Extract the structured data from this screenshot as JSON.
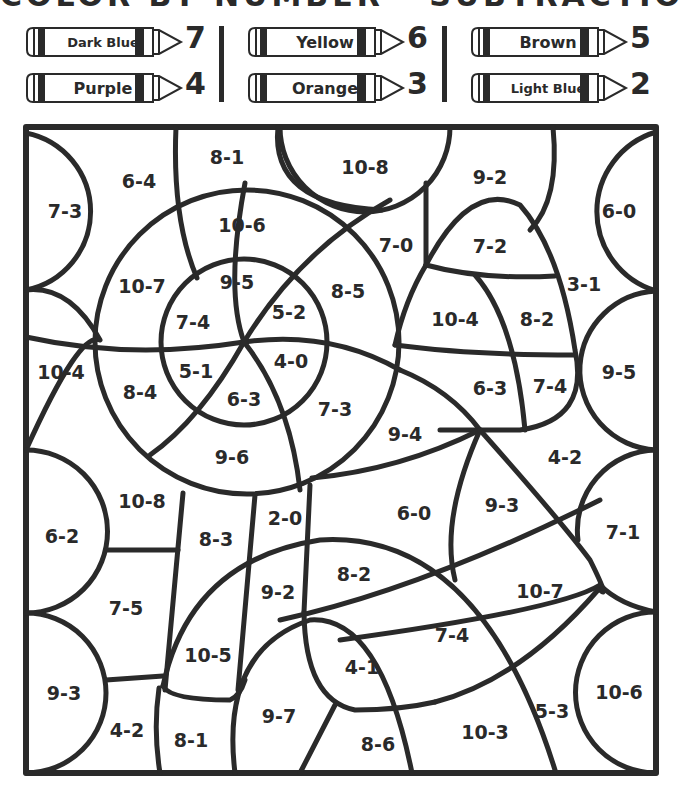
{
  "title": "COLOR BY NUMBER - SUBTRACTION",
  "legend": [
    {
      "color": "Dark Blue",
      "number": "7",
      "x": 25,
      "y": 26
    },
    {
      "color": "Purple",
      "number": "4",
      "x": 25,
      "y": 72
    },
    {
      "color": "Yellow",
      "number": "6",
      "x": 247,
      "y": 26
    },
    {
      "color": "Orange",
      "number": "3",
      "x": 247,
      "y": 72
    },
    {
      "color": "Brown",
      "number": "5",
      "x": 470,
      "y": 26
    },
    {
      "color": "Light Blue",
      "number": "2",
      "x": 470,
      "y": 72
    }
  ],
  "regions": [
    {
      "label": "7-3",
      "x": 65,
      "y": 212
    },
    {
      "label": "6-4",
      "x": 139,
      "y": 182
    },
    {
      "label": "8-1",
      "x": 227,
      "y": 158
    },
    {
      "label": "10-8",
      "x": 365,
      "y": 168
    },
    {
      "label": "9-2",
      "x": 490,
      "y": 178
    },
    {
      "label": "6-0",
      "x": 619,
      "y": 212
    },
    {
      "label": "10-6",
      "x": 242,
      "y": 226
    },
    {
      "label": "7-0",
      "x": 396,
      "y": 246
    },
    {
      "label": "7-2",
      "x": 490,
      "y": 247
    },
    {
      "label": "10-7",
      "x": 142,
      "y": 287
    },
    {
      "label": "9-5",
      "x": 237,
      "y": 283
    },
    {
      "label": "8-5",
      "x": 348,
      "y": 292
    },
    {
      "label": "3-1",
      "x": 584,
      "y": 285
    },
    {
      "label": "7-4",
      "x": 193,
      "y": 323
    },
    {
      "label": "5-2",
      "x": 289,
      "y": 313
    },
    {
      "label": "10-4",
      "x": 455,
      "y": 320
    },
    {
      "label": "8-2",
      "x": 537,
      "y": 320
    },
    {
      "label": "10-4",
      "x": 61,
      "y": 373
    },
    {
      "label": "5-1",
      "x": 196,
      "y": 372
    },
    {
      "label": "4-0",
      "x": 291,
      "y": 362
    },
    {
      "label": "8-4",
      "x": 140,
      "y": 393
    },
    {
      "label": "6-3",
      "x": 244,
      "y": 400
    },
    {
      "label": "6-3",
      "x": 490,
      "y": 389
    },
    {
      "label": "7-4",
      "x": 550,
      "y": 387
    },
    {
      "label": "9-5",
      "x": 619,
      "y": 373
    },
    {
      "label": "7-3",
      "x": 335,
      "y": 410
    },
    {
      "label": "9-4",
      "x": 405,
      "y": 435
    },
    {
      "label": "9-6",
      "x": 232,
      "y": 458
    },
    {
      "label": "4-2",
      "x": 565,
      "y": 458
    },
    {
      "label": "10-8",
      "x": 142,
      "y": 502
    },
    {
      "label": "9-3",
      "x": 502,
      "y": 506
    },
    {
      "label": "6-0",
      "x": 414,
      "y": 514
    },
    {
      "label": "2-0",
      "x": 285,
      "y": 519
    },
    {
      "label": "7-1",
      "x": 623,
      "y": 533
    },
    {
      "label": "6-2",
      "x": 62,
      "y": 537
    },
    {
      "label": "8-3",
      "x": 216,
      "y": 540
    },
    {
      "label": "8-2",
      "x": 354,
      "y": 575
    },
    {
      "label": "10-7",
      "x": 540,
      "y": 592
    },
    {
      "label": "9-2",
      "x": 278,
      "y": 593
    },
    {
      "label": "7-5",
      "x": 126,
      "y": 609
    },
    {
      "label": "7-4",
      "x": 452,
      "y": 636
    },
    {
      "label": "10-5",
      "x": 208,
      "y": 656
    },
    {
      "label": "4-1",
      "x": 362,
      "y": 668
    },
    {
      "label": "9-3",
      "x": 64,
      "y": 694
    },
    {
      "label": "10-6",
      "x": 619,
      "y": 693
    },
    {
      "label": "9-7",
      "x": 279,
      "y": 717
    },
    {
      "label": "5-3",
      "x": 552,
      "y": 712
    },
    {
      "label": "4-2",
      "x": 127,
      "y": 731
    },
    {
      "label": "10-3",
      "x": 485,
      "y": 733
    },
    {
      "label": "8-1",
      "x": 191,
      "y": 741
    },
    {
      "label": "8-6",
      "x": 378,
      "y": 745
    }
  ],
  "colors": {
    "ink": "#2a2a2a",
    "paper": "#ffffff"
  }
}
